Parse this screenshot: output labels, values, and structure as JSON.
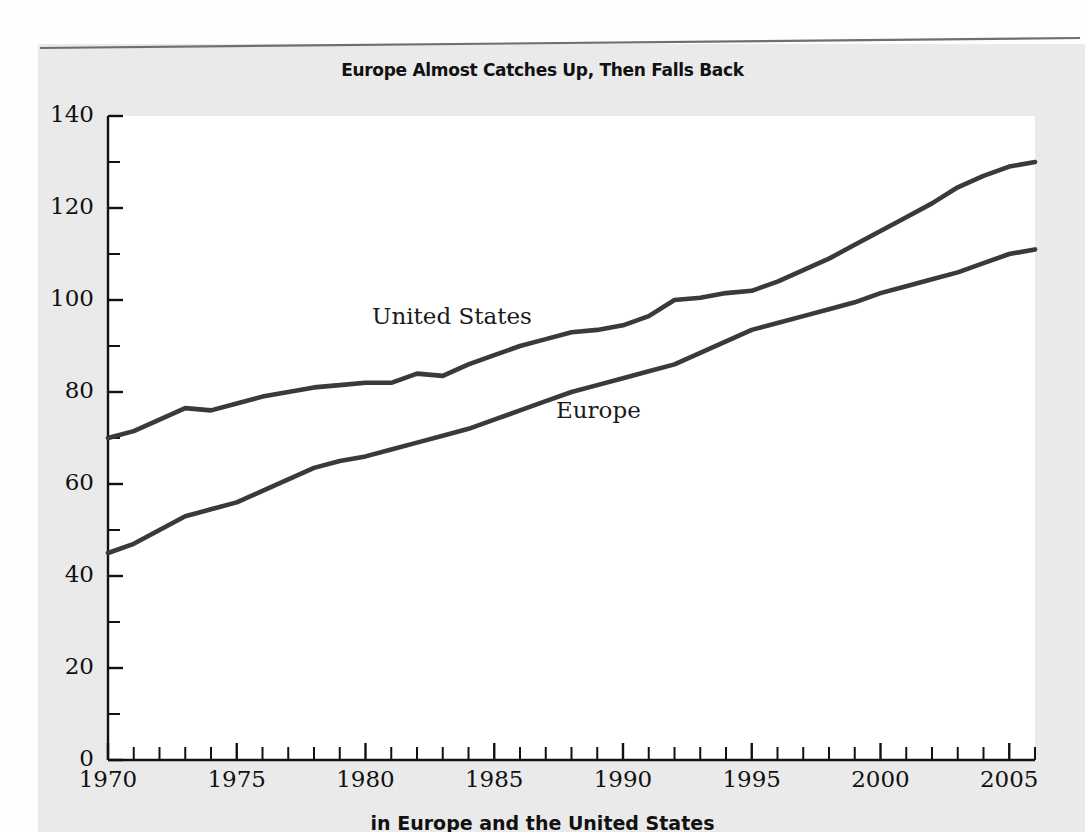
{
  "figure": {
    "title": "Europe Almost Catches Up, Then Falls Back",
    "caption": "in Europe and the United States"
  },
  "chart_data": {
    "type": "line",
    "title": "Europe Almost Catches Up, Then Falls Back",
    "xlabel": "",
    "ylabel": "",
    "xlim": [
      1970,
      2006
    ],
    "ylim": [
      0,
      140
    ],
    "grid": false,
    "legend_position": "inline-labels",
    "x_tick_labels": [
      "1970",
      "1975",
      "1980",
      "1985",
      "1990",
      "1995",
      "2000",
      "2005"
    ],
    "x_tick_values": [
      1970,
      1975,
      1980,
      1985,
      1990,
      1995,
      2000,
      2005
    ],
    "x_minor_tick_step": 1,
    "y_tick_labels": [
      "0",
      "20",
      "40",
      "60",
      "80",
      "100",
      "120",
      "140"
    ],
    "y_tick_values": [
      0,
      20,
      40,
      60,
      80,
      100,
      120,
      140
    ],
    "y_minor_tick_step": 10,
    "line_color": "#3a3a3a",
    "x": [
      1970,
      1971,
      1972,
      1973,
      1974,
      1975,
      1976,
      1977,
      1978,
      1979,
      1980,
      1981,
      1982,
      1983,
      1984,
      1985,
      1986,
      1987,
      1988,
      1989,
      1990,
      1991,
      1992,
      1993,
      1994,
      1995,
      1996,
      1997,
      1998,
      1999,
      2000,
      2001,
      2002,
      2003,
      2004,
      2005,
      2006
    ],
    "series": [
      {
        "name": "United States",
        "values": [
          70,
          71.5,
          74,
          76.5,
          76,
          77.5,
          79,
          80,
          81,
          81.5,
          82,
          82,
          84,
          83.5,
          86,
          88,
          90,
          91.5,
          93,
          93.5,
          94.5,
          96.5,
          100,
          100.5,
          101.5,
          102,
          104,
          106.5,
          109,
          112,
          115,
          118,
          121,
          124.5,
          127,
          129,
          130
        ]
      },
      {
        "name": "Europe",
        "values": [
          45,
          47,
          50,
          53,
          54.5,
          56,
          58.5,
          61,
          63.5,
          65,
          66,
          67.5,
          69,
          70.5,
          72,
          74,
          76,
          78,
          80,
          81.5,
          83,
          84.5,
          86,
          88.5,
          91,
          93.5,
          95,
          96.5,
          98,
          99.5,
          101.5,
          103,
          104.5,
          106,
          108,
          110,
          111
        ]
      }
    ]
  }
}
